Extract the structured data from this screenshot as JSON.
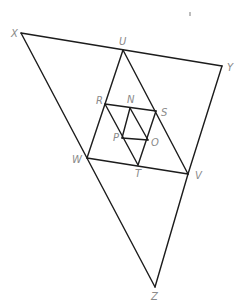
{
  "diagram": {
    "type": "nested-triangles",
    "points": {
      "X": [
        21,
        33
      ],
      "U": [
        123,
        50
      ],
      "Y": [
        222,
        66
      ],
      "V": [
        188,
        174
      ],
      "W": [
        87,
        158
      ],
      "Z": [
        155,
        287
      ],
      "R": [
        105,
        104
      ],
      "N": [
        130,
        108
      ],
      "S": [
        156,
        111
      ],
      "P": [
        122,
        138
      ],
      "O": [
        148,
        140
      ],
      "T": [
        138,
        165
      ]
    },
    "labels": [
      {
        "text": "X",
        "x": 11,
        "y": 37
      },
      {
        "text": "U",
        "x": 119,
        "y": 45
      },
      {
        "text": "Y",
        "x": 227,
        "y": 71
      },
      {
        "text": "V",
        "x": 195,
        "y": 179
      },
      {
        "text": "W",
        "x": 72,
        "y": 163
      },
      {
        "text": "Z",
        "x": 151,
        "y": 300
      },
      {
        "text": "R",
        "x": 96,
        "y": 104
      },
      {
        "text": "N",
        "x": 127,
        "y": 103
      },
      {
        "text": "S",
        "x": 161,
        "y": 116
      },
      {
        "text": "P",
        "x": 113,
        "y": 141
      },
      {
        "text": "O",
        "x": 151,
        "y": 146
      },
      {
        "text": "T",
        "x": 135,
        "y": 177
      }
    ],
    "segments": [
      [
        "X",
        "Y"
      ],
      [
        "Y",
        "V"
      ],
      [
        "X",
        "Z"
      ],
      [
        "V",
        "Z"
      ],
      [
        "U",
        "W"
      ],
      [
        "U",
        "V"
      ],
      [
        "W",
        "V"
      ],
      [
        "R",
        "S"
      ],
      [
        "R",
        "T"
      ],
      [
        "S",
        "T"
      ],
      [
        "N",
        "P"
      ],
      [
        "N",
        "O"
      ],
      [
        "P",
        "O"
      ]
    ]
  }
}
